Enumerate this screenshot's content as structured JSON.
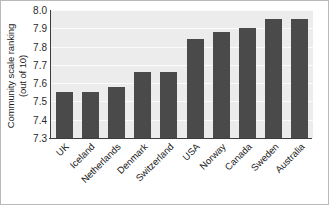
{
  "chart_data": {
    "type": "bar",
    "title": "",
    "xlabel": "",
    "ylabel_line1": "Community scale ranking",
    "ylabel_line2": "(out of 10)",
    "categories": [
      "UK",
      "Iceland",
      "Netherlands",
      "Denmark",
      "Switzerland",
      "USA",
      "Norway",
      "Canada",
      "Sweden",
      "Australia"
    ],
    "values": [
      7.55,
      7.55,
      7.58,
      7.66,
      7.66,
      7.84,
      7.88,
      7.9,
      7.95,
      7.95
    ],
    "ylim": [
      7.3,
      8.0
    ],
    "ytick_labels": [
      "8.0",
      "7.9",
      "7.8",
      "7.7",
      "7.6",
      "7.5",
      "7.4",
      "7.3"
    ],
    "ytick_values": [
      8.0,
      7.9,
      7.8,
      7.7,
      7.6,
      7.5,
      7.4,
      7.3
    ],
    "grid": true,
    "legend": "none",
    "bar_color": "#4a4a4a",
    "plot_background": "#ececec",
    "axis_color": "#3c3c3c"
  }
}
